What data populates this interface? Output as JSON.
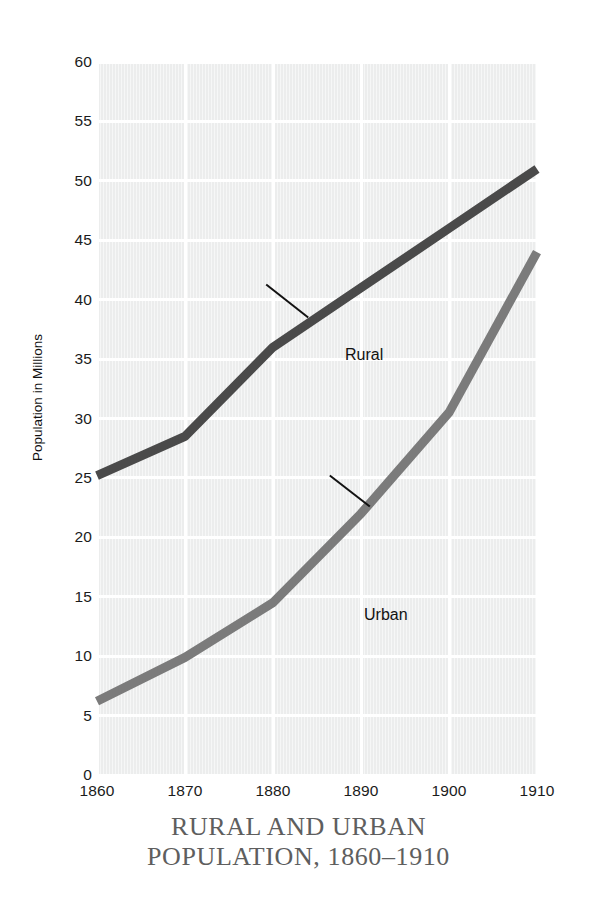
{
  "chart_data": {
    "type": "line",
    "title_line1": "RURAL AND URBAN",
    "title_line2": "POPULATION, 1860–1910",
    "xlabel": "",
    "ylabel": "Population in Millions",
    "x": [
      1860,
      1870,
      1880,
      1890,
      1900,
      1910
    ],
    "xticklabels": [
      "1860",
      "1870",
      "1880",
      "1890",
      "1900",
      "1910"
    ],
    "xlim": [
      1860,
      1910
    ],
    "ylim": [
      0,
      60
    ],
    "yticks": [
      0,
      5,
      10,
      15,
      20,
      25,
      30,
      35,
      40,
      45,
      50,
      55,
      60
    ],
    "yticklabels": [
      "0",
      "5",
      "10",
      "15",
      "20",
      "25",
      "30",
      "35",
      "40",
      "45",
      "50",
      "55",
      "60"
    ],
    "grid": true,
    "legend_position": "inline-annotations",
    "series": [
      {
        "name": "Rural",
        "color": "#4a4a4a",
        "values": [
          25.2,
          28.5,
          36.0,
          41.0,
          46.0,
          51.0
        ]
      },
      {
        "name": "Urban",
        "color": "#7b7b7b",
        "values": [
          6.2,
          9.9,
          14.5,
          22.0,
          30.5,
          44.0
        ]
      }
    ],
    "annotations": [
      {
        "label": "Rural",
        "target_x": 1884,
        "target_y": 38.5,
        "note": "leader line from label down-right to rural curve"
      },
      {
        "label": "Urban",
        "target_x": 1891,
        "target_y": 22.6,
        "note": "leader line from label down-right to urban curve"
      }
    ],
    "colors": {
      "plot_background": "#eceded",
      "gridline": "#ffffff",
      "tick_text": "#1b1b1b",
      "title_text": "#5e5e5e",
      "rural_series": "#4a4a4a",
      "urban_series": "#7b7b7b"
    }
  }
}
